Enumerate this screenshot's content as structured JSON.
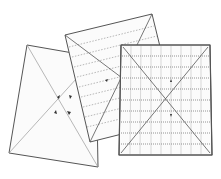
{
  "diagram": {
    "title": "",
    "colors": {
      "background": "#ffffff",
      "sheet_fill": "#fbfbfb",
      "outline": "#555555",
      "guide_line": "#9a9a9a",
      "grid_line": "#c8c8c8",
      "arrow": "#333333"
    },
    "sheets": [
      {
        "id": "left",
        "label": "",
        "pattern": "diagonal-cross",
        "corners": [
          [
            27,
            45
          ],
          [
            96,
            57
          ],
          [
            98,
            167
          ],
          [
            9,
            153
          ]
        ],
        "arrows": 4
      },
      {
        "id": "middle",
        "label": "",
        "pattern": "horizontal-dashed-lines",
        "corners": [
          [
            65,
            35
          ],
          [
            152,
            14
          ],
          [
            178,
            120
          ],
          [
            90,
            142
          ]
        ],
        "line_count": 9
      },
      {
        "id": "right",
        "label": "",
        "pattern": "grid-with-diagonal-cross",
        "corners": [
          [
            121,
            45
          ],
          [
            210,
            45
          ],
          [
            212,
            155
          ],
          [
            119,
            155
          ]
        ],
        "arrows": 2
      }
    ]
  }
}
